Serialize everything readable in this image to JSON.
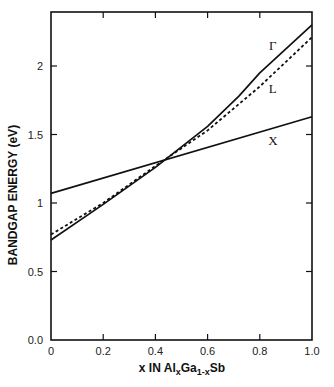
{
  "chart_data": {
    "type": "line",
    "title": "",
    "xlabel": "x IN Al_xGa_1-xSb",
    "xlabel_parts": {
      "pre": "x IN Al",
      "sub1": "x",
      "mid": "Ga",
      "sub2": "1-x",
      "post": "Sb"
    },
    "ylabel": "BANDGAP ENERGY (eV)",
    "xlim": [
      0,
      1.0
    ],
    "ylim": [
      0.0,
      2.35
    ],
    "x_ticks": [
      "0",
      "0.2",
      "0.4",
      "0.6",
      "0.8",
      "1.0"
    ],
    "y_ticks": [
      "0.0",
      "0.5",
      "1",
      "1.5",
      "2"
    ],
    "grid": false,
    "series": [
      {
        "name": "Γ",
        "style": "solid",
        "x": [
          0,
          0.2,
          0.4,
          0.6,
          0.72,
          0.8,
          1.0
        ],
        "values": [
          0.73,
          0.99,
          1.26,
          1.56,
          1.78,
          1.95,
          2.3
        ]
      },
      {
        "name": "L",
        "style": "dashed",
        "x": [
          0,
          0.2,
          0.4,
          0.6,
          0.8,
          1.0
        ],
        "values": [
          0.77,
          1.0,
          1.27,
          1.53,
          1.85,
          2.21
        ]
      },
      {
        "name": "X",
        "style": "solid",
        "x": [
          0,
          1.0
        ],
        "values": [
          1.07,
          1.63
        ]
      }
    ],
    "annotations": [
      {
        "text": "Γ",
        "x": 0.85,
        "y": 2.15
      },
      {
        "text": "L",
        "x": 0.85,
        "y": 1.84
      },
      {
        "text": "X",
        "x": 0.85,
        "y": 1.46
      }
    ]
  }
}
